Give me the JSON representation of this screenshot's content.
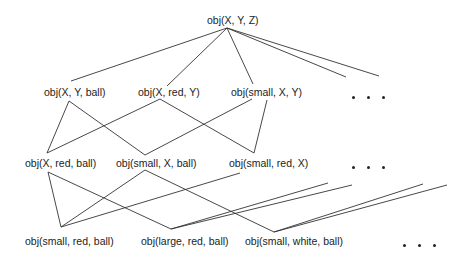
{
  "diagram": {
    "type": "generalization-lattice",
    "root": {
      "id": "n0",
      "label": "obj(X, Y, Z)"
    },
    "level1": [
      {
        "id": "n1",
        "label": "obj(X, Y, ball)"
      },
      {
        "id": "n2",
        "label": "obj(X, red, Y)"
      },
      {
        "id": "n3",
        "label": "obj(small, X, Y)"
      }
    ],
    "level2": [
      {
        "id": "n4",
        "label": "obj(X, red, ball)"
      },
      {
        "id": "n5",
        "label": "obj(small, X, ball)"
      },
      {
        "id": "n6",
        "label": "obj(small, red, X)"
      }
    ],
    "level3": [
      {
        "id": "n7",
        "label": "obj(small, red, ball)"
      },
      {
        "id": "n8",
        "label": "obj(large, red, ball)"
      },
      {
        "id": "n9",
        "label": "obj(small, white, ball)"
      }
    ],
    "ellipsis": "• • •",
    "edges": [
      [
        "n0",
        "n1"
      ],
      [
        "n0",
        "n2"
      ],
      [
        "n0",
        "n3"
      ],
      [
        "n0",
        "more-1a"
      ],
      [
        "n0",
        "more-1b"
      ],
      [
        "n1",
        "n4"
      ],
      [
        "n1",
        "n5"
      ],
      [
        "n2",
        "n4"
      ],
      [
        "n2",
        "n6"
      ],
      [
        "n3",
        "n5"
      ],
      [
        "n3",
        "n6"
      ],
      [
        "n4",
        "n7"
      ],
      [
        "n4",
        "n8"
      ],
      [
        "n5",
        "n7"
      ],
      [
        "n5",
        "n9"
      ],
      [
        "n6",
        "n7"
      ],
      [
        "n8",
        "more-3a"
      ],
      [
        "n8",
        "more-3b"
      ],
      [
        "n9",
        "more-3c"
      ],
      [
        "n9",
        "more-3d"
      ]
    ]
  }
}
